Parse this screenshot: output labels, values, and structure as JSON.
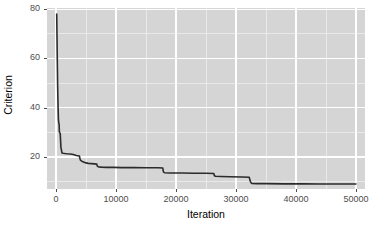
{
  "chart_data": {
    "type": "line",
    "title": "",
    "xlabel": "Iteration",
    "ylabel": "Criterion",
    "xlim": [
      -1500,
      51500
    ],
    "ylim": [
      7.0,
      80.5
    ],
    "xticks": [
      0,
      10000,
      20000,
      30000,
      40000,
      50000
    ],
    "xtick_labels": [
      "0",
      "10000",
      "20000",
      "30000",
      "40000",
      "50000"
    ],
    "yticks": [
      20,
      40,
      60,
      80
    ],
    "ytick_labels": [
      "20",
      "40",
      "60",
      "80"
    ],
    "x_minor_ticks": [
      5000,
      15000,
      25000,
      35000,
      45000
    ],
    "y_minor_ticks": [
      10,
      30,
      50,
      70
    ],
    "grid": true,
    "legend": "none",
    "panel_background": "#d5d5d5",
    "grid_major_color": "#ffffff",
    "grid_minor_color": "#ededed",
    "line_color": "#2b2b2b",
    "line_width": 1.6,
    "series": [
      {
        "name": "criterion",
        "x": [
          120,
          200,
          280,
          340,
          400,
          460,
          520,
          560,
          620,
          700,
          820,
          1000,
          1200,
          1500,
          1900,
          2400,
          2900,
          3400,
          3900,
          4000,
          4100,
          4300,
          4600,
          5000,
          5400,
          5900,
          6400,
          6800,
          6900,
          7100,
          7600,
          8400,
          9500,
          11000,
          13000,
          15000,
          17000,
          17800,
          17900,
          18100,
          19000,
          21000,
          23000,
          25000,
          26300,
          26400,
          26600,
          27500,
          29000,
          31000,
          32200,
          32400,
          32600,
          33500,
          35000,
          38000,
          41000,
          44000,
          47000,
          50000
        ],
        "y": [
          78.0,
          62.0,
          48.0,
          41.0,
          35.5,
          33.8,
          33.4,
          30.2,
          29.9,
          29.6,
          24.0,
          21.6,
          21.5,
          21.4,
          21.3,
          21.2,
          21.0,
          20.6,
          20.4,
          19.3,
          18.6,
          18.3,
          18.0,
          17.6,
          17.4,
          17.3,
          17.2,
          17.1,
          16.2,
          16.0,
          15.9,
          15.8,
          15.8,
          15.7,
          15.7,
          15.6,
          15.6,
          15.5,
          14.0,
          13.6,
          13.5,
          13.5,
          13.4,
          13.4,
          13.3,
          12.4,
          12.2,
          12.1,
          12.0,
          11.9,
          11.8,
          10.0,
          9.3,
          9.2,
          9.2,
          9.1,
          9.1,
          9.0,
          9.0,
          9.0
        ]
      }
    ]
  }
}
